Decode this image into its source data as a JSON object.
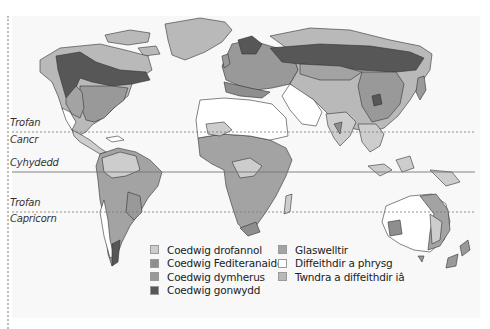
{
  "map": {
    "latitude_lines": [
      {
        "name": "tropic-of-cancer",
        "labels": [
          "Trofan",
          "Cancr"
        ],
        "style": "dashed"
      },
      {
        "name": "equator",
        "labels": [
          "Cyhydedd"
        ],
        "style": "solid"
      },
      {
        "name": "tropic-of-capricorn",
        "labels": [
          "Trofan",
          "Capricorn"
        ],
        "style": "dashed"
      }
    ],
    "labels": {
      "cancer_1": "Trofan",
      "cancer_2": "Cancr",
      "equator": "Cyhydedd",
      "capricorn_1": "Trofan",
      "capricorn_2": "Capricorn"
    }
  },
  "legend": {
    "items": [
      {
        "label": "Coedwig drofannol",
        "color": "#cdcdcd"
      },
      {
        "label": "Coedwig Fediteranaidd",
        "color": "#8e8e8e"
      },
      {
        "label": "Coedwig dymherus",
        "color": "#999999"
      },
      {
        "label": "Coedwig gonwydd",
        "color": "#575757"
      },
      {
        "label": "Glaswelltir",
        "color": "#a3a3a3"
      },
      {
        "label": "Diffeithdir a phrysg",
        "color": "#ffffff"
      },
      {
        "label": "Twndra a diffeithdir iâ",
        "color": "#b9b9b9"
      }
    ]
  }
}
